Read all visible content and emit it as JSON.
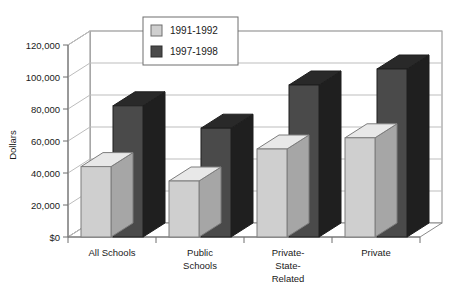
{
  "chart_data": {
    "type": "bar",
    "title": "",
    "subtitle": "",
    "xlabel": "",
    "ylabel": "Dollars",
    "categories": [
      "All Schools",
      "Public Schools",
      "Private-State-Related",
      "Private"
    ],
    "category_lines": [
      [
        "All Schools"
      ],
      [
        "Public",
        "Schools"
      ],
      [
        "Private-",
        "State-",
        "Related"
      ],
      [
        "Private"
      ]
    ],
    "series": [
      {
        "name": "1991-1992",
        "color": "#cfcfcf",
        "values": [
          44000,
          35000,
          55000,
          62000
        ]
      },
      {
        "name": "1997-1998",
        "color": "#4a4a4a",
        "values": [
          82000,
          68000,
          95000,
          105000
        ]
      }
    ],
    "ylim": [
      0,
      120000
    ],
    "ytick_values": [
      0,
      20000,
      40000,
      60000,
      80000,
      100000,
      120000
    ],
    "ytick_labels": [
      "$0",
      "20,000",
      "40,000",
      "60,000",
      "80,000",
      "100,000",
      "120,000"
    ],
    "grid": true,
    "grid_axis": "y",
    "legend_position": "top-center",
    "style": "3d-bar",
    "background": "#ffffff",
    "axis_color": "#6e6e6e",
    "grid_color": "#bdbdbd"
  },
  "legend": {
    "entries": [
      {
        "label": "1991-1992",
        "swatch": "#cfcfcf"
      },
      {
        "label": "1997-1998",
        "swatch": "#4a4a4a"
      }
    ]
  },
  "axes": {
    "y_title": "Dollars"
  }
}
